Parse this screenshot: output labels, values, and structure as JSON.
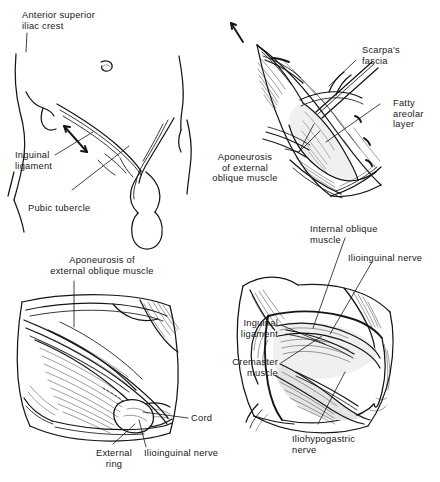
{
  "figure": {
    "background_color": "#ffffff",
    "ink_color": "#14151a",
    "panel_count": 4
  },
  "panels": [
    {
      "id": "panel-1",
      "name": "surface-anatomy-landmarks",
      "caption": "Surface anatomy of the groin with bony landmarks and planned incision",
      "labels": [
        {
          "name": "anterior-superior-iliac-crest",
          "lines": [
            "Anterior superior",
            "iliac crest"
          ],
          "align": "left"
        },
        {
          "name": "inguinal-ligament",
          "lines": [
            "Inguinal",
            "ligament"
          ],
          "align": "left"
        },
        {
          "name": "pubic-tubercle",
          "lines": [
            "Pubic tubercle"
          ],
          "align": "left"
        }
      ]
    },
    {
      "id": "panel-2",
      "name": "superficial-fascial-layers",
      "caption": "Incision opened showing fatty and membranous fascial layers",
      "labels": [
        {
          "name": "scarpas-fascia",
          "lines": [
            "Scarpa's",
            "fascia"
          ],
          "align": "left"
        },
        {
          "name": "fatty-areolar-layer",
          "lines": [
            "Fatty",
            "areolar",
            "layer"
          ],
          "align": "left"
        },
        {
          "name": "aponeurosis-of-external-oblique-muscle",
          "lines": [
            "Aponeurosis",
            "of external",
            "oblique muscle"
          ],
          "align": "center"
        }
      ]
    },
    {
      "id": "panel-3",
      "name": "external-oblique-aponeurosis-exposed",
      "caption": "External oblique aponeurosis exposed with external ring and cord",
      "labels": [
        {
          "name": "aponeurosis-of-external-oblique-muscle",
          "lines": [
            "Aponeurosis of",
            "external oblique muscle"
          ],
          "align": "center"
        },
        {
          "name": "cord",
          "lines": [
            "Cord"
          ],
          "align": "left"
        },
        {
          "name": "external-ring",
          "lines": [
            "External",
            "ring"
          ],
          "align": "center"
        },
        {
          "name": "ilioinguinal-nerve",
          "lines": [
            "Ilioinguinal nerve"
          ],
          "align": "left"
        }
      ]
    },
    {
      "id": "panel-4",
      "name": "aponeurosis-opened-cord-structures",
      "caption": "Aponeurosis divided and retracted exposing cord, muscle and nerves",
      "labels": [
        {
          "name": "internal-oblique-muscle",
          "lines": [
            "Internal oblique",
            "muscle"
          ],
          "align": "left"
        },
        {
          "name": "ilioinguinal-nerve",
          "lines": [
            "Ilioinguinal nerve"
          ],
          "align": "left"
        },
        {
          "name": "inguinal-ligament",
          "lines": [
            "Inguinal",
            "ligament"
          ],
          "align": "right"
        },
        {
          "name": "cremaster-muscle",
          "lines": [
            "Cremaster",
            "muscle"
          ],
          "align": "right"
        },
        {
          "name": "iliohypogastric-nerve",
          "lines": [
            "Iliohypogastric",
            "nerve"
          ],
          "align": "left"
        }
      ]
    }
  ],
  "label_text": {
    "p1_asis_l1": "Anterior superior",
    "p1_asis_l2": "iliac crest",
    "p1_ing_l1": "Inguinal",
    "p1_ing_l2": "ligament",
    "p1_pubic": "Pubic tubercle",
    "p2_scarpa_l1": "Scarpa's",
    "p2_scarpa_l2": "fascia",
    "p2_fatty_l1": "Fatty",
    "p2_fatty_l2": "areolar",
    "p2_fatty_l3": "layer",
    "p2_apo_l1": "Aponeurosis",
    "p2_apo_l2": "of external",
    "p2_apo_l3": "oblique muscle",
    "p3_apo_l1": "Aponeurosis of",
    "p3_apo_l2": "external oblique muscle",
    "p3_cord": "Cord",
    "p3_ring_l1": "External",
    "p3_ring_l2": "ring",
    "p3_ilio": "Ilioinguinal nerve",
    "p4_io_l1": "Internal oblique",
    "p4_io_l2": "muscle",
    "p4_ilio": "Ilioinguinal nerve",
    "p4_ing_l1": "Inguinal",
    "p4_ing_l2": "ligament",
    "p4_crem_l1": "Cremaster",
    "p4_crem_l2": "muscle",
    "p4_ihg_l1": "Iliohypogastric",
    "p4_ihg_l2": "nerve"
  }
}
